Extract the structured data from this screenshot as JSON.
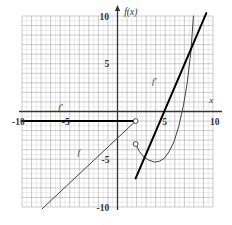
{
  "chart_data": {
    "type": "line",
    "title": "",
    "xlabel": "x",
    "ylabel": "f(x)",
    "xlim": [
      -10,
      10
    ],
    "ylim": [
      -10,
      10
    ],
    "grid": true,
    "minor_grid": true,
    "grid_step_major": 1,
    "grid_step_minor": 0.5,
    "x_ticks": [
      -10,
      -5,
      5,
      10
    ],
    "y_ticks": [
      10,
      5,
      -5,
      -10
    ],
    "x_tick_labels": [
      "-10",
      "-5",
      "5",
      "10"
    ],
    "y_tick_labels": [
      "10",
      "5",
      "-5",
      "-10"
    ],
    "legend": [],
    "annotations": [
      {
        "text": "f'",
        "x": -6.2,
        "y": 0.2
      },
      {
        "text": "f'",
        "x": 3.6,
        "y": 2.9
      },
      {
        "text": "f",
        "x": -4.2,
        "y": -4.6
      },
      {
        "text": "f(x)",
        "x": 0.7,
        "y": 10.1
      },
      {
        "text": "x",
        "x": 9.6,
        "y": 0.85
      }
    ],
    "series": [
      {
        "name": "f-left-line",
        "style": "thin",
        "comment": "thin straight line of f on the left, slope ~1, from (-7.9,-10.2) up to (1.9,-1.0)",
        "points": [
          [
            -7.9,
            -10.2
          ],
          [
            1.9,
            -1.0
          ]
        ]
      },
      {
        "name": "f-right-curve",
        "style": "thin",
        "comment": "thin parabola-like branch of f beginning at open point (1.9,-3.4), minimum near (4.3,-5.2), rising steeply to (7.9,10.0)",
        "points": [
          [
            1.9,
            -3.4
          ],
          [
            2.3,
            -4.2
          ],
          [
            2.8,
            -4.8
          ],
          [
            3.3,
            -5.1
          ],
          [
            3.9,
            -5.3
          ],
          [
            4.4,
            -5.2
          ],
          [
            4.9,
            -4.9
          ],
          [
            5.4,
            -4.2
          ],
          [
            5.9,
            -3.2
          ],
          [
            6.4,
            -1.6
          ],
          [
            6.9,
            0.6
          ],
          [
            7.3,
            3.0
          ],
          [
            7.7,
            6.4
          ],
          [
            7.95,
            10.0
          ]
        ]
      },
      {
        "name": "fprime-constant",
        "style": "thick",
        "comment": "thick horizontal segment of f' at y = -1 from x=-10 to x=1.9 (open endpoint)",
        "points": [
          [
            -10.0,
            -1.0
          ],
          [
            1.9,
            -1.0
          ]
        ]
      },
      {
        "name": "fprime-linear",
        "style": "thick",
        "comment": "thick steep straight segment of f' from (1.9,-7.0) up to (9.3,10.3)",
        "points": [
          [
            1.9,
            -7.0
          ],
          [
            9.3,
            10.3
          ]
        ]
      }
    ],
    "open_points": [
      {
        "x": 1.9,
        "y": -1.0,
        "on": "fprime-constant"
      },
      {
        "x": 1.9,
        "y": -3.4,
        "on": "f-right-curve"
      }
    ],
    "colors": {
      "grid_minor": "#d8d8d8",
      "grid_major": "#a8a8a8",
      "axis": "#333333",
      "curve_thin": "#444444",
      "curve_thick": "#000000",
      "background": "#ffffff",
      "text": "#333333"
    }
  }
}
